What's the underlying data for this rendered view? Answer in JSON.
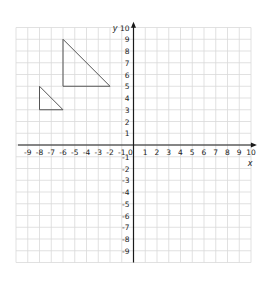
{
  "chart_data": {
    "type": "diagram",
    "title": "",
    "xlabel": "x",
    "ylabel": "y",
    "xlim": [
      -10,
      10
    ],
    "ylim": [
      -10,
      10
    ],
    "grid": true,
    "x_ticks": [
      "-9",
      "-8",
      "-7",
      "-6",
      "-5",
      "-4",
      "-3",
      "-2",
      "-1",
      "0",
      "1",
      "2",
      "3",
      "4",
      "5",
      "6",
      "7",
      "8",
      "9",
      "10"
    ],
    "y_ticks_positive": [
      "1",
      "2",
      "3",
      "4",
      "5",
      "6",
      "7",
      "8",
      "9",
      "10"
    ],
    "y_ticks_negative": [
      "-1",
      "-2",
      "-3",
      "-4",
      "-5",
      "-6",
      "-7",
      "-8",
      "-9"
    ],
    "shapes": [
      {
        "name": "large-triangle",
        "vertices": [
          [
            -6,
            9
          ],
          [
            -6,
            5
          ],
          [
            -2,
            5
          ]
        ]
      },
      {
        "name": "small-triangle",
        "vertices": [
          [
            -8,
            5
          ],
          [
            -8,
            3
          ],
          [
            -6,
            3
          ]
        ]
      }
    ]
  },
  "colors": {
    "grid": "#d9d9d9",
    "axis": "#1a1a1a",
    "shape": "#555555"
  }
}
